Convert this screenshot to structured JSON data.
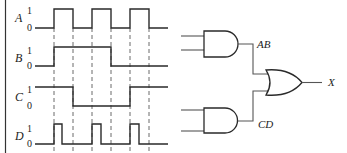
{
  "timing": {
    "level_high": "1",
    "level_low": "0",
    "guide_x": [
      54,
      73,
      92,
      111,
      130,
      149
    ],
    "signals": [
      {
        "name": "A",
        "high_y": 9,
        "low_y": 28,
        "points": "35,28 54,28 54,9 73,9 73,28 92,28 92,9 111,9 111,28 130,28 130,9 149,9 149,28 168,28"
      },
      {
        "name": "B",
        "high_y": 47,
        "low_y": 66,
        "points": "35,66 54,66 54,47 111,47 111,66 168,66"
      },
      {
        "name": "C",
        "high_y": 87,
        "low_y": 106,
        "points": "35,87 73,87 73,106 130,106 130,87 168,87"
      },
      {
        "name": "D",
        "high_y": 124,
        "low_y": 144,
        "points": "35,144 54,144 54,124 62,124 62,144 92,144 92,124 101,124 101,144 130,144 130,124 139,124 139,144 168,144"
      }
    ]
  },
  "circuit": {
    "gates": [
      {
        "type": "AND",
        "id": "and-ab"
      },
      {
        "type": "AND",
        "id": "and-cd"
      },
      {
        "type": "OR",
        "id": "or-x"
      }
    ],
    "net_labels": {
      "ab": "AB",
      "cd": "CD",
      "output": "X"
    }
  }
}
